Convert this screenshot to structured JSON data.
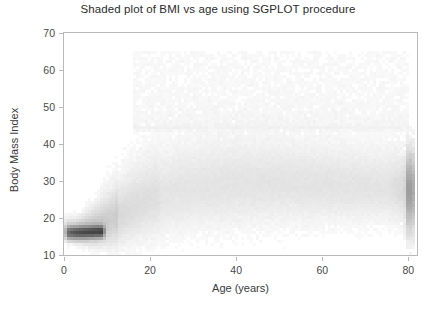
{
  "chart_data": {
    "type": "scatter",
    "render_style": "shaded-density-bins",
    "title": "Shaded plot of BMI vs age using SGPLOT procedure",
    "xlabel": "Age (years)",
    "ylabel": "Body Mass Index",
    "xlim": [
      0,
      82
    ],
    "ylim": [
      10,
      70
    ],
    "xticks": [
      0,
      20,
      40,
      60,
      80
    ],
    "yticks": [
      10,
      20,
      30,
      40,
      50,
      60,
      70
    ],
    "xtick_labels": [
      "0",
      "20",
      "40",
      "60",
      "80"
    ],
    "ytick_labels": [
      "10",
      "20",
      "30",
      "40",
      "50",
      "60",
      "70"
    ],
    "grid": false,
    "legend": "none",
    "frame": "box",
    "marker_color": "#777777",
    "bin_px": 3,
    "density_profile": {
      "comment": "Piecewise centre/spread/intensity of the point cloud read off the figure.",
      "x": [
        1,
        3,
        5,
        8,
        11,
        14,
        17,
        20,
        25,
        30,
        35,
        40,
        45,
        50,
        55,
        60,
        65,
        70,
        75,
        80
      ],
      "center_bmi": [
        16.2,
        16.0,
        16.2,
        17.2,
        19.0,
        21.0,
        23.0,
        24.5,
        26.5,
        27.5,
        28.2,
        28.6,
        28.8,
        28.8,
        28.6,
        28.4,
        28.2,
        28.0,
        27.6,
        27.4
      ],
      "spread_bmi": [
        1.4,
        1.6,
        2.2,
        3.2,
        4.6,
        5.6,
        6.4,
        6.8,
        7.2,
        7.4,
        7.4,
        7.4,
        7.2,
        7.0,
        6.8,
        6.6,
        6.4,
        6.2,
        6.0,
        5.8
      ],
      "intensity": [
        0.95,
        1.0,
        0.92,
        0.72,
        0.55,
        0.46,
        0.42,
        0.4,
        0.4,
        0.42,
        0.44,
        0.45,
        0.45,
        0.44,
        0.43,
        0.42,
        0.4,
        0.38,
        0.36,
        0.95
      ]
    },
    "max_bmi_observed": 65,
    "min_bmi_observed": 13,
    "topcoded_age_stripe": 80
  },
  "colors": {
    "frame": "#b9b9b9",
    "title_text": "#2b2b2b",
    "axis_text": "#4a4a4a",
    "label_text": "#3a3a3a",
    "background": "#ffffff",
    "ink": "#5c5c5c"
  }
}
